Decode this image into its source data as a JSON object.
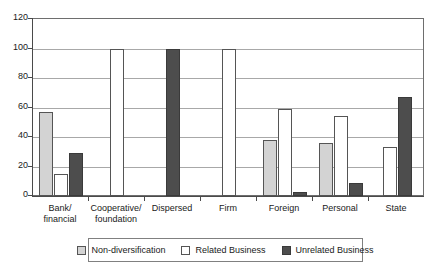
{
  "chart_data": {
    "type": "bar",
    "title": "",
    "xlabel": "",
    "ylabel": "",
    "ylim": [
      0,
      120
    ],
    "yticks": [
      0,
      20,
      40,
      60,
      80,
      100,
      120
    ],
    "grid": true,
    "legend_position": "bottom",
    "categories": [
      "Bank/\nfinancial",
      "Cooperative/\nfoundation",
      "Dispersed",
      "Firm",
      "Foreign",
      "Personal",
      "State"
    ],
    "series": [
      {
        "name": "Non-diversification",
        "color": "#d3d3d3",
        "values": [
          57,
          0,
          0,
          0,
          38,
          36,
          0
        ]
      },
      {
        "name": "Related Business",
        "color": "#ffffff",
        "values": [
          15,
          100,
          0,
          100,
          59,
          54,
          33
        ]
      },
      {
        "name": "Unrelated Business",
        "color": "#4d4d4d",
        "values": [
          29,
          0,
          100,
          0,
          3,
          9,
          67
        ]
      }
    ]
  }
}
